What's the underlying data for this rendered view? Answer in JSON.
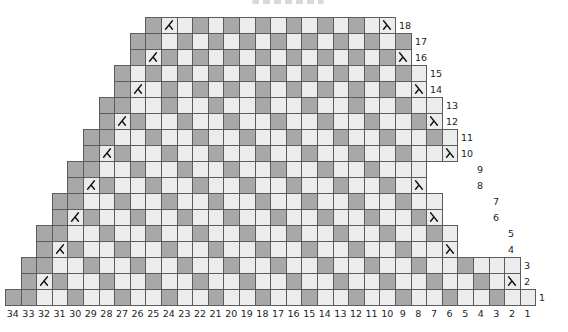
{
  "chart": {
    "type": "knitting-decrease-chart",
    "columns": 34,
    "rows": 18,
    "cell_legend": {
      "D": "dark contrast stitch",
      "L": "light main-color stitch",
      "K": "k2tog decrease symbol (left slope)",
      "S": "ssk decrease symbol (right slope)",
      ".": "no stitch (outside shaping)"
    },
    "colors": {
      "dark_cell": "#a8a8a8",
      "light_cell": "#ececec",
      "gridline": "#5c5c5c",
      "symbol": "#111111",
      "number_text": "#1c1c1c",
      "background": "#ffffff"
    },
    "rows_data": [
      {
        "row": 18,
        "cells": ".........DKLDLDLDLDLDLDLS........."
      },
      {
        "row": 17,
        "cells": "........DDLDLDLDLDLDLDLDLD........"
      },
      {
        "row": 16,
        "cells": "........DKDLDLDLDLDLDLDLDS........"
      },
      {
        "row": 15,
        "cells": ".......DLDLDLDLDLDLDLDLDLDL......."
      },
      {
        "row": 14,
        "cells": ".......DKLDLDLDLDLDLDLDLDLS......."
      },
      {
        "row": 13,
        "cells": "......DDLLDLLDLLDLLDLLDLLDLL......"
      },
      {
        "row": 12,
        "cells": "......DKDLLDLLDLLDLLDLLDLLDS......"
      },
      {
        "row": 11,
        "cells": ".....DDLLDLLDLLDLLDLLDLLDLLDL....."
      },
      {
        "row": 10,
        "cells": ".....DKDLLDLLDLLDLLDLLDLLDLLS....."
      },
      {
        "row": 9,
        "cells": "....DDLLDLLDLLDLLDLLDLLDLLL...."
      },
      {
        "row": 8,
        "cells": "....DKDLLDLLDLLDLLDLLDLLDLS...."
      },
      {
        "row": 7,
        "cells": "...DDLLDLLDLLDLLDLLDLLDLLDLL..."
      },
      {
        "row": 6,
        "cells": "...DKDLLDLLDLLDLLDLLDLLDLLDS..."
      },
      {
        "row": 5,
        "cells": "..DDLLDLLDLLDLLDLLDLLDLLDLLDL.."
      },
      {
        "row": 4,
        "cells": "..DKDLLDLLDLLDLLDLLDLLDLLDLLS.."
      },
      {
        "row": 3,
        "cells": ".DDLLDLLDLLDLLDLLDLLDLLDLLDLLDLLL."
      },
      {
        "row": 2,
        "cells": ".DKDLLDLLDLLDLLDLLDLLDLLDLLDLLDLS."
      },
      {
        "row": 1,
        "cells": "DDLLDLLDLLDLLDLLDLLDLLDLLDLLDLLDLL"
      }
    ],
    "bottom_numbers": [
      "34",
      "33",
      "32",
      "31",
      "30",
      "29",
      "28",
      "27",
      "26",
      "25",
      "24",
      "23",
      "22",
      "21",
      "20",
      "19",
      "18",
      "17",
      "16",
      "15",
      "14",
      "13",
      "12",
      "11",
      "10",
      "9",
      "8",
      "7",
      "6",
      "5",
      "4",
      "3",
      "2",
      "1"
    ],
    "right_numbers": [
      "18",
      "17",
      "16",
      "15",
      "14",
      "13",
      "12",
      "11",
      "10",
      "9",
      "8",
      "7",
      "6",
      "5",
      "4",
      "3",
      "2",
      "1"
    ]
  }
}
